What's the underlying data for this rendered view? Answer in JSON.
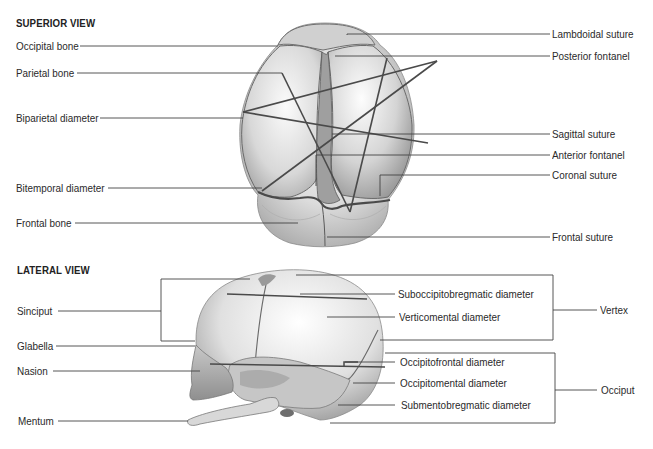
{
  "superior_view": {
    "heading": "SUPERIOR VIEW",
    "left_labels": [
      "Occipital bone",
      "Parietal bone",
      "Biparietal diameter",
      "Bitemporal diameter",
      "Frontal bone"
    ],
    "right_labels": [
      "Lambdoidal suture",
      "Posterior fontanel",
      "Sagittal suture",
      "Anterior fontanel",
      "Coronal suture",
      "Frontal suture"
    ]
  },
  "lateral_view": {
    "heading": "LATERAL VIEW",
    "left_labels": [
      "Sinciput",
      "Glabella",
      "Nasion",
      "Mentum"
    ],
    "diameter_labels": [
      "Suboccipitobregmatic diameter",
      "Verticomental diameter",
      "Occipitofrontal diameter",
      "Occipitomental diameter",
      "Submentobregmatic diameter"
    ],
    "bracket_labels": [
      "Vertex",
      "Occiput"
    ]
  },
  "colors": {
    "line": "#3a3a3a",
    "text": "#2a2a2a",
    "skull_shade": "#bdbdbd"
  }
}
